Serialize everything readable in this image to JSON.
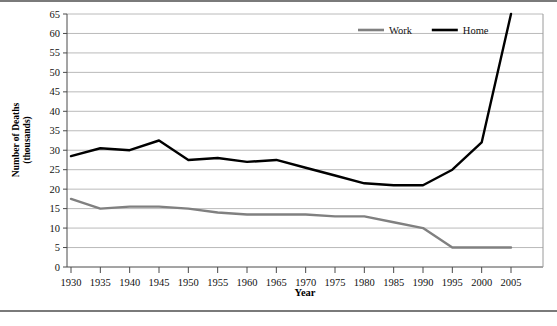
{
  "chart_data": {
    "type": "line",
    "title": "",
    "xlabel": "Year",
    "ylabel": "Number of Deaths (thousands)",
    "ylabel_line1": "Number of Deaths",
    "ylabel_line2": "(thousands)",
    "x": [
      1930,
      1935,
      1940,
      1945,
      1950,
      1955,
      1960,
      1965,
      1970,
      1975,
      1980,
      1985,
      1990,
      1995,
      2000,
      2005
    ],
    "xtick_labels": [
      "1930",
      "1935",
      "1940",
      "1945",
      "1950",
      "1955",
      "1960",
      "1965",
      "1970",
      "1975",
      "1980",
      "1985",
      "1990",
      "1995",
      "2000",
      "2005"
    ],
    "ytick_labels": [
      "0",
      "5",
      "10",
      "15",
      "20",
      "25",
      "30",
      "35",
      "40",
      "45",
      "50",
      "55",
      "60",
      "65"
    ],
    "ytick_values": [
      0,
      5,
      10,
      15,
      20,
      25,
      30,
      35,
      40,
      45,
      50,
      55,
      60,
      65
    ],
    "ylim": [
      0,
      65
    ],
    "xlim": [
      1930,
      2005
    ],
    "grid": "horizontal",
    "legend_position": "top-center",
    "series": [
      {
        "name": "Work",
        "color": "#808080",
        "width": 2.4,
        "values": [
          17.5,
          15.0,
          15.5,
          15.5,
          15.0,
          14.0,
          13.5,
          13.5,
          13.5,
          13.0,
          13.0,
          11.5,
          10.0,
          5.0,
          5.0,
          5.0
        ]
      },
      {
        "name": "Home",
        "color": "#000000",
        "width": 2.4,
        "values": [
          28.5,
          30.5,
          30.0,
          32.5,
          27.5,
          28.0,
          27.0,
          27.5,
          25.5,
          23.5,
          21.5,
          21.0,
          21.0,
          25.0,
          32.0,
          65.0
        ]
      }
    ],
    "legend": [
      {
        "label": "Work",
        "color": "#808080"
      },
      {
        "label": "Home",
        "color": "#000000"
      }
    ]
  }
}
